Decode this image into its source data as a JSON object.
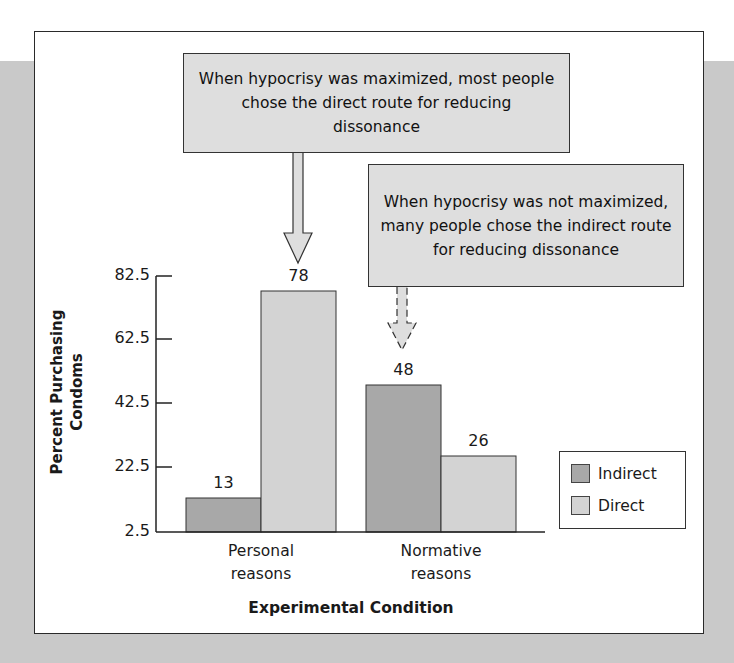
{
  "callouts": [
    {
      "text": "When hypocrisy was maximized, most people chose the direct route for reducing dissonance"
    },
    {
      "text": "When hypocrisy was not maximized, many people chose the indirect route for reducing dissonance"
    }
  ],
  "axes": {
    "y_title": "Percent Purchasing Condoms",
    "x_title": "Experimental Condition",
    "y_ticks": [
      "82.5",
      "62.5",
      "42.5",
      "22.5",
      "2.5"
    ]
  },
  "categories": [
    {
      "label": "Personal reasons"
    },
    {
      "label": "Normative reasons"
    }
  ],
  "bar_labels": {
    "personal_indirect": "13",
    "personal_direct": "78",
    "normative_indirect": "48",
    "normative_direct": "26"
  },
  "legend": {
    "items": [
      {
        "label": "Indirect",
        "color": "#a8a8a8"
      },
      {
        "label": "Direct",
        "color": "#d3d3d3"
      }
    ]
  },
  "colors": {
    "indirect": "#a8a8a8",
    "direct": "#d3d3d3",
    "callout_fill": "#dedede",
    "background": "#c9c9c9"
  },
  "chart_data": {
    "type": "bar",
    "title": "",
    "categories": [
      "Personal reasons",
      "Normative reasons"
    ],
    "series": [
      {
        "name": "Indirect",
        "values": [
          13,
          48
        ]
      },
      {
        "name": "Direct",
        "values": [
          78,
          26
        ]
      }
    ],
    "xlabel": "Experimental Condition",
    "ylabel": "Percent Purchasing Condoms",
    "ylim": [
      2.5,
      82.5
    ],
    "yticks": [
      2.5,
      22.5,
      42.5,
      62.5,
      82.5
    ],
    "grid": false,
    "legend_position": "right",
    "annotations": [
      {
        "text": "When hypocrisy was maximized, most people chose the direct route for reducing dissonance",
        "points_to": "Personal reasons / Direct"
      },
      {
        "text": "When hypocrisy was not maximized, many people chose the indirect route for reducing dissonance",
        "points_to": "Normative reasons / Indirect"
      }
    ]
  }
}
